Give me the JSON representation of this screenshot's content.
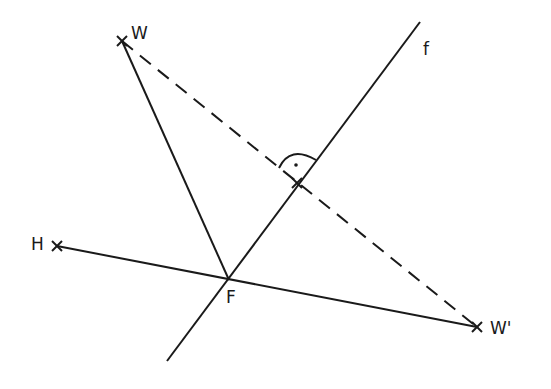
{
  "diagram": {
    "type": "geometry-reflection",
    "stroke_color": "#1a1a1a",
    "background": "#ffffff",
    "points": {
      "W": {
        "label": "W",
        "x": 122,
        "y": 41
      },
      "H": {
        "label": "H",
        "x": 57,
        "y": 246
      },
      "F": {
        "label": "F",
        "x": 229,
        "y": 280
      },
      "W_prime": {
        "label": "W'",
        "x": 477,
        "y": 327
      },
      "M": {
        "x": 297,
        "y": 183
      }
    },
    "line_f": {
      "label": "f",
      "x1": 167,
      "y1": 361,
      "x2": 420,
      "y2": 22
    },
    "segments": [
      {
        "from": "W",
        "to": "F",
        "style": "solid"
      },
      {
        "from": "H",
        "to": "W_prime",
        "style": "solid"
      },
      {
        "from": "W",
        "to": "W_prime",
        "style": "dashed"
      }
    ],
    "right_angle_marker": {
      "at": "M",
      "has_dot": true
    }
  }
}
